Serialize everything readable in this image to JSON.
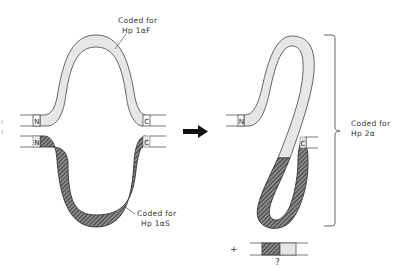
{
  "figure": {
    "left_panel": {
      "top_gene": {
        "label_line1": "Coded for",
        "label_line2": "Hp 1αF",
        "n_terminus": "N",
        "c_terminus": "C",
        "fill": "light-stipple"
      },
      "bottom_gene": {
        "label_line1": "Coded for",
        "label_line2": "Hp 1αS",
        "n_terminus": "N",
        "c_terminus": "C",
        "fill": "dark-hatched"
      }
    },
    "arrow": {
      "direction": "right",
      "icon": "right-arrow-icon"
    },
    "right_panel": {
      "fused_gene": {
        "n_terminus": "N",
        "c_terminus": "C",
        "label_line1": "Coded for",
        "label_line2": "Hp 2α"
      },
      "bracket": "right-curly-bracket",
      "byproduct": {
        "plus_sign": "+",
        "question_mark": "?"
      }
    },
    "colors": {
      "outline": "#555555",
      "light_fill": "#e6e6e6",
      "dark_hatch_bg": "#7a7a7a",
      "hatch_line": "#222222",
      "text": "#333333",
      "arrow": "#111111"
    }
  }
}
